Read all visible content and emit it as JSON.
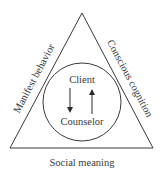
{
  "diagram": {
    "sides": {
      "left": "Manifest behavior",
      "right": "Conscious cognition",
      "bottom": "Social meaning"
    },
    "circle": {
      "top": "Client",
      "bottom": "Counselor",
      "arrows": [
        "down-arrow",
        "up-arrow"
      ]
    },
    "colors": {
      "stroke": "#3a3a3a",
      "text": "#3a3a3a",
      "background": "#ffffff"
    }
  }
}
